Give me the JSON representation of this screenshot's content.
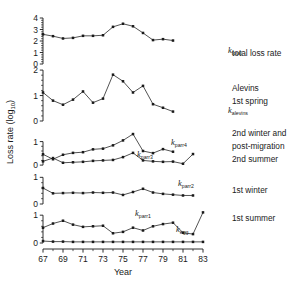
{
  "figure": {
    "ylabel": "Loss rate (log",
    "ylabel_sub": "10",
    "ylabel_tail": ")",
    "xlabel": "Year",
    "background_color": "#ffffff",
    "ink_color": "#1a1a1a"
  },
  "xaxis": {
    "ticks": [
      "67",
      "69",
      "71",
      "73",
      "75",
      "77",
      "79",
      "81",
      "83"
    ],
    "min": 67,
    "max": 83,
    "minor_step": 1
  },
  "legend": {
    "entries": [
      {
        "id": "total",
        "text": "total loss rate"
      },
      {
        "id": "alevins_a",
        "text": "Alevins"
      },
      {
        "id": "alevins_b",
        "text": "1st spring"
      },
      {
        "id": "parr4_a",
        "text": "2nd winter and"
      },
      {
        "id": "parr4_b",
        "text": "post-migration"
      },
      {
        "id": "parr3",
        "text": "2nd summer"
      },
      {
        "id": "parr2",
        "text": "1st winter"
      },
      {
        "id": "parr1",
        "text": "1st summer"
      }
    ]
  },
  "curve_labels": [
    {
      "id": "k-total",
      "base": "k",
      "sub": "total",
      "x": 228,
      "y": 53
    },
    {
      "id": "k-alevins",
      "base": "k",
      "sub": "alevins",
      "x": 228,
      "y": 113
    },
    {
      "id": "k-parr4",
      "base": "k",
      "sub": "parr4",
      "x": 171,
      "y": 145
    },
    {
      "id": "k-parr3",
      "base": "k",
      "sub": "parr3",
      "x": 137,
      "y": 157
    },
    {
      "id": "k-parr2",
      "base": "k",
      "sub": "parr2",
      "x": 178,
      "y": 186
    },
    {
      "id": "k-parr1",
      "base": "k",
      "sub": "parr1",
      "x": 135,
      "y": 216
    },
    {
      "id": "k-egg",
      "base": "k",
      "sub": "egg",
      "x": 176,
      "y": 232
    }
  ],
  "chart_data": {
    "type": "line",
    "title": "",
    "xlabel": "Year",
    "ylabel": "Loss rate (log10)",
    "grid": false,
    "legend_position": "right",
    "x": [
      67,
      68,
      69,
      70,
      71,
      72,
      73,
      74,
      75,
      76,
      77,
      78,
      79,
      80,
      81,
      82,
      83
    ],
    "panels": [
      {
        "id": "panel-total",
        "ylim": [
          0,
          4
        ],
        "yticks": [
          0,
          1,
          2,
          3,
          4
        ],
        "ytick_labels": [
          "0",
          "1",
          "2",
          "3",
          "4"
        ],
        "yminor_step": 0.2,
        "legend": "total loss rate",
        "series": [
          {
            "name": "k_total",
            "x": [
              67,
              68,
              69,
              70,
              71,
              72,
              73,
              74,
              75,
              76,
              77,
              78,
              79,
              80,
              81
            ],
            "values": [
              2.58,
              2.42,
              2.22,
              2.27,
              2.45,
              2.45,
              2.5,
              3.23,
              3.5,
              3.28,
              2.7,
              2.08,
              2.16,
              2.04,
              null
            ]
          }
        ]
      },
      {
        "id": "panel-alevins",
        "ylim": [
          0,
          2.2
        ],
        "yticks": [
          0,
          1,
          2
        ],
        "ytick_labels": [
          "0",
          "1",
          "2"
        ],
        "yminor_step": 0.2,
        "legend": "Alevins 1st spring",
        "series": [
          {
            "name": "k_alevins",
            "x": [
              67,
              68,
              69,
              70,
              71,
              72,
              73,
              74,
              75,
              76,
              77,
              78,
              79,
              80
            ],
            "values": [
              1.12,
              0.8,
              0.64,
              0.84,
              1.16,
              0.72,
              0.88,
              1.82,
              1.56,
              1.12,
              1.38,
              0.66,
              0.52,
              0.37
            ]
          }
        ]
      },
      {
        "id": "panel-parr34",
        "ylim": [
          -0.25,
          1.45
        ],
        "yticks": [
          0,
          1
        ],
        "ytick_labels": [
          "0",
          "1"
        ],
        "yminor_step": 0.2,
        "legend": "2nd winter and post-migration / 2nd summer",
        "series": [
          {
            "name": "k_parr4",
            "x": [
              67,
              68,
              69,
              70,
              71,
              72,
              73,
              74,
              75,
              76,
              77,
              78,
              79,
              80
            ],
            "values": [
              0.46,
              0.25,
              0.44,
              0.52,
              0.55,
              0.67,
              0.7,
              0.84,
              1.05,
              1.32,
              0.6,
              0.51,
              0.68,
              0.57
            ]
          },
          {
            "name": "k_parr3",
            "x": [
              67,
              68,
              69,
              70,
              71,
              72,
              73,
              74,
              75,
              76,
              77,
              78,
              79,
              80,
              81,
              82
            ],
            "values": [
              0.16,
              0.3,
              0.1,
              0.12,
              0.14,
              0.18,
              0.2,
              0.22,
              0.34,
              0.52,
              0.2,
              0.16,
              0.14,
              0.15,
              0.06,
              0.47
            ]
          }
        ]
      },
      {
        "id": "panel-parr2",
        "ylim": [
          0,
          1.05
        ],
        "yticks": [
          0,
          1
        ],
        "ytick_labels": [
          "0",
          "1"
        ],
        "yminor_step": 0.2,
        "legend": "1st winter",
        "series": [
          {
            "name": "k_parr2",
            "x": [
              67,
              68,
              69,
              70,
              71,
              72,
              73,
              74,
              75,
              76,
              77,
              78,
              79,
              80,
              81,
              82
            ],
            "values": [
              0.6,
              0.4,
              0.41,
              0.42,
              0.41,
              0.43,
              0.42,
              0.43,
              0.34,
              0.45,
              0.57,
              0.43,
              0.38,
              0.35,
              0.32,
              0.32
            ]
          }
        ]
      },
      {
        "id": "panel-parr1",
        "ylim": [
          0,
          1.15
        ],
        "yticks": [
          0,
          1
        ],
        "ytick_labels": [
          "0",
          "1"
        ],
        "yminor_step": 0.2,
        "legend": "1st summer",
        "series": [
          {
            "name": "k_parr1",
            "x": [
              67,
              68,
              69,
              70,
              71,
              72,
              73,
              74,
              75,
              76,
              77,
              78,
              79,
              80,
              81,
              82,
              83
            ],
            "values": [
              0.55,
              0.7,
              0.8,
              0.66,
              0.58,
              0.6,
              0.62,
              0.35,
              0.4,
              0.55,
              0.45,
              0.6,
              0.68,
              0.73,
              0.37,
              0.32,
              1.1
            ]
          },
          {
            "name": "k_egg",
            "x": [
              67,
              68,
              69,
              70,
              71,
              72,
              73,
              74,
              75,
              76,
              77,
              78,
              79,
              80,
              81,
              82,
              83
            ],
            "values": [
              0.07,
              0.05,
              0.05,
              0.04,
              0.04,
              0.04,
              0.04,
              0.04,
              0.04,
              0.04,
              0.04,
              0.04,
              0.04,
              0.04,
              0.04,
              0.04,
              0.04
            ]
          }
        ]
      }
    ]
  }
}
